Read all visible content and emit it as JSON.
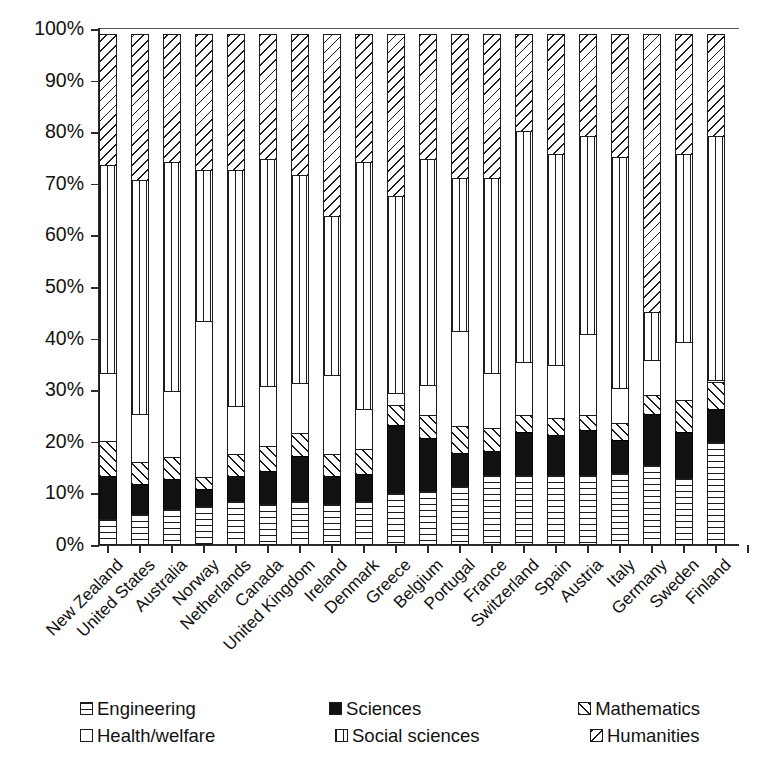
{
  "chart_data": {
    "type": "bar",
    "subtype": "stacked-bar-100-percent",
    "title": "",
    "xlabel": "",
    "ylabel": "",
    "ylim": [
      0,
      100
    ],
    "ytick_labels": [
      "100%",
      "90%",
      "80%",
      "70%",
      "60%",
      "50%",
      "40%",
      "30%",
      "20%",
      "10%",
      "0%"
    ],
    "ytick_values": [
      100,
      90,
      80,
      70,
      60,
      50,
      40,
      30,
      20,
      10,
      0
    ],
    "grid": false,
    "legend_position": "bottom",
    "stack_order_bottom_to_top": [
      "Engineering",
      "Sciences",
      "Mathematics",
      "Health/welfare",
      "Social sciences",
      "Humanities"
    ],
    "categories": [
      "New Zealand",
      "United States",
      "Australia",
      "Norway",
      "Netherlands",
      "Canada",
      "United Kingdom",
      "Ireland",
      "Denmark",
      "Greece",
      "Belgium",
      "Portugal",
      "France",
      "Switzerland",
      "Spain",
      "Austria",
      "Italy",
      "Germany",
      "Sweden",
      "Finland"
    ],
    "series": [
      {
        "name": "Engineering",
        "pattern": "horizontal-lines",
        "values": [
          5.0,
          6.0,
          7.0,
          7.5,
          8.5,
          8.0,
          8.5,
          8.0,
          8.5,
          10.0,
          10.5,
          11.5,
          13.5,
          13.5,
          13.5,
          13.5,
          14.0,
          15.5,
          13.0,
          20.0
        ]
      },
      {
        "name": "Sciences",
        "pattern": "solid-black",
        "values": [
          8.5,
          6.0,
          6.0,
          3.5,
          5.0,
          6.5,
          9.0,
          5.5,
          5.5,
          13.5,
          10.5,
          6.5,
          5.0,
          8.5,
          8.0,
          9.0,
          6.5,
          10.0,
          9.0,
          6.5
        ]
      },
      {
        "name": "Mathematics",
        "pattern": "backward-diagonal",
        "values": [
          7.0,
          4.5,
          4.5,
          2.5,
          4.5,
          5.0,
          4.5,
          4.5,
          5.0,
          4.0,
          4.5,
          5.5,
          4.5,
          3.5,
          3.5,
          3.0,
          3.5,
          4.0,
          6.5,
          5.5
        ]
      },
      {
        "name": "Health/welfare",
        "pattern": "white",
        "values": [
          13.5,
          9.5,
          13.0,
          30.5,
          9.5,
          12.0,
          10.0,
          15.5,
          8.0,
          2.5,
          6.0,
          18.5,
          11.0,
          10.5,
          10.5,
          16.0,
          7.0,
          7.0,
          11.5,
          0.5
        ]
      },
      {
        "name": "Social sciences",
        "pattern": "vertical-lines",
        "values": [
          40.5,
          45.5,
          44.5,
          29.5,
          46.0,
          44.0,
          40.5,
          31.0,
          48.0,
          38.5,
          44.0,
          30.0,
          38.0,
          45.0,
          41.0,
          38.5,
          45.0,
          9.5,
          36.5,
          47.5
        ]
      },
      {
        "name": "Humanities",
        "pattern": "forward-diagonal",
        "values": [
          25.5,
          28.5,
          25.0,
          26.5,
          26.5,
          24.5,
          27.5,
          35.5,
          25.0,
          31.5,
          24.5,
          28.0,
          28.0,
          19.0,
          23.5,
          20.0,
          24.0,
          54.0,
          23.5,
          20.0
        ]
      }
    ],
    "cumulative_tops": {
      "New Zealand": [
        5.0,
        13.5,
        20.5,
        34.0,
        74.5,
        100
      ],
      "United States": [
        6.0,
        12.0,
        16.5,
        26.0,
        71.5,
        100
      ],
      "Australia": [
        7.0,
        13.0,
        17.5,
        30.5,
        75.0,
        100
      ],
      "Norway": [
        7.5,
        11.0,
        13.5,
        44.0,
        73.5,
        100
      ],
      "Netherlands": [
        8.5,
        13.5,
        18.0,
        27.5,
        73.5,
        100
      ],
      "Canada": [
        8.0,
        14.5,
        19.5,
        31.5,
        75.5,
        100
      ],
      "United Kingdom": [
        8.5,
        17.5,
        22.0,
        32.0,
        72.5,
        100
      ],
      "Ireland": [
        8.0,
        13.5,
        18.0,
        33.5,
        64.5,
        100
      ],
      "Denmark": [
        8.5,
        14.0,
        19.0,
        27.0,
        75.0,
        100
      ],
      "Greece": [
        10.0,
        23.5,
        27.5,
        30.0,
        68.5,
        100
      ],
      "Belgium": [
        10.5,
        21.0,
        25.5,
        31.5,
        75.5,
        100
      ],
      "Portugal": [
        11.5,
        18.0,
        23.5,
        42.0,
        72.0,
        100
      ],
      "France": [
        13.5,
        18.5,
        23.0,
        34.0,
        72.0,
        100
      ],
      "Switzerland": [
        13.5,
        22.0,
        25.5,
        36.0,
        81.0,
        100
      ],
      "Spain": [
        13.5,
        21.5,
        25.0,
        35.5,
        76.5,
        100
      ],
      "Austria": [
        13.5,
        22.5,
        25.5,
        41.5,
        80.0,
        100
      ],
      "Italy": [
        14.0,
        20.5,
        24.0,
        31.0,
        76.0,
        100
      ],
      "Germany": [
        15.5,
        25.5,
        29.5,
        36.5,
        46.0,
        100
      ],
      "Sweden": [
        13.0,
        22.0,
        28.5,
        40.0,
        76.5,
        100
      ],
      "Finland": [
        20.0,
        26.5,
        32.0,
        32.5,
        80.0,
        100
      ]
    }
  },
  "legend": {
    "rows": [
      [
        {
          "label": "Engineering",
          "pattern": "horizontal-lines"
        },
        {
          "label": "Sciences",
          "pattern": "solid-black"
        },
        {
          "label": "Mathematics",
          "pattern": "backward-diagonal"
        }
      ],
      [
        {
          "label": "Health/welfare",
          "pattern": "white"
        },
        {
          "label": "Social sciences",
          "pattern": "vertical-lines"
        },
        {
          "label": "Humanities",
          "pattern": "forward-diagonal"
        }
      ]
    ]
  },
  "colors": {
    "ink": "#1c1c1c",
    "background": "#ffffff",
    "sciences_fill": "#111111"
  }
}
